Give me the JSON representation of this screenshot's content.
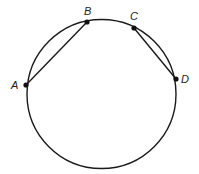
{
  "diagram": {
    "type": "geometry-circle-chords",
    "circle": {
      "cx": 101.5,
      "cy": 94,
      "r": 74.5,
      "stroke": "#1a1a1a"
    },
    "points": [
      {
        "id": "A",
        "label": "A",
        "x": 26,
        "y": 85,
        "label_x": 11,
        "label_y": 80
      },
      {
        "id": "B",
        "label": "B",
        "x": 87,
        "y": 22,
        "label_x": 84,
        "label_y": 6
      },
      {
        "id": "C",
        "label": "C",
        "x": 134,
        "y": 28,
        "label_x": 130,
        "label_y": 11
      },
      {
        "id": "D",
        "label": "D",
        "x": 176,
        "y": 79,
        "label_x": 181,
        "label_y": 74
      }
    ],
    "chords": [
      {
        "from": "A",
        "to": "B"
      },
      {
        "from": "C",
        "to": "D"
      }
    ]
  }
}
